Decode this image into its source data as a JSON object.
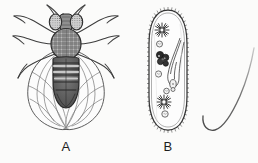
{
  "figure": {
    "background_color": "#fbfbfa",
    "ink_color": "#333333",
    "panels": [
      {
        "id": "fly",
        "label": "A",
        "subject": "fruit-fly-dorsal-view",
        "description": "Line drawing of a fruit fly (Drosophila) seen from above, showing head with two large compound eyes, antennae, cross-hatched thorax, banded abdomen, six legs and two overlapping veined wings.",
        "parts": [
          "antenna-left",
          "antenna-right",
          "compound-eye-left",
          "compound-eye-right",
          "head",
          "thorax",
          "abdomen",
          "abdominal-bands",
          "wing-left",
          "wing-right",
          "wing-veins",
          "leg-foreleg-left",
          "leg-foreleg-right",
          "leg-midleg-left",
          "leg-midleg-right",
          "leg-hindleg-left",
          "leg-hindleg-right"
        ],
        "abdominal_band_count": 5,
        "leg_count": 6,
        "wing_count": 2
      },
      {
        "id": "paramecium",
        "label": "B",
        "subject": "paramecium-protozoan",
        "description": "Line drawing of a Paramecium, an oval single-celled ciliate, outlined with fine cilia and containing two star-shaped contractile vacuoles, a dark macronucleus cluster, several round food vacuoles and an oral groove leading to the gullet.",
        "parts": [
          "pellicle-outline",
          "cilia-fringe",
          "anterior-contractile-vacuole",
          "posterior-contractile-vacuole",
          "macronucleus",
          "micronucleus",
          "food-vacuole",
          "oral-groove",
          "gullet",
          "cytopharynx"
        ],
        "contractile_vacuole_count": 2,
        "food_vacuole_count": 4
      },
      {
        "id": "curve",
        "label": "",
        "subject": "curved-filament",
        "description": "A single thin curved line, hook or needle shaped, rising from a rounded bottom at the lower left to a fine tapering point at the upper right.",
        "parts": [
          "curved-stroke"
        ]
      }
    ]
  },
  "captions": {
    "a": "A",
    "b": "B"
  }
}
